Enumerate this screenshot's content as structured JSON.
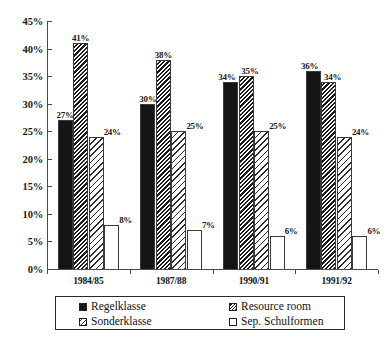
{
  "chart_data": {
    "type": "bar",
    "title": "",
    "subtitle": "",
    "xlabel": "",
    "ylabel": "",
    "ylim": [
      0,
      45
    ],
    "ytick_labels": [
      "0%",
      "5%",
      "10%",
      "15%",
      "20%",
      "25%",
      "30%",
      "35%",
      "40%",
      "45%"
    ],
    "ytick_values": [
      0,
      5,
      10,
      15,
      20,
      25,
      30,
      35,
      40,
      45
    ],
    "grid": false,
    "legend_position": "bottom",
    "value_suffix": "%",
    "categories": [
      "1984/85",
      "1987/88",
      "1990/91",
      "1991/92"
    ],
    "series": [
      {
        "name": "Regelklasse",
        "pattern": "solid",
        "values": [
          27,
          30,
          34,
          36
        ],
        "labels": [
          "27%",
          "30%",
          "34%",
          "36%"
        ]
      },
      {
        "name": "Resource room",
        "pattern": "dense-hatch",
        "values": [
          41,
          38,
          35,
          34
        ],
        "labels": [
          "41%",
          "38%",
          "35%",
          "34%"
        ]
      },
      {
        "name": "Sonderklasse",
        "pattern": "light-hatch",
        "values": [
          24,
          25,
          25,
          24
        ],
        "labels": [
          "24%",
          "25%",
          "25%",
          "24%"
        ]
      },
      {
        "name": "Sep. Schulformen",
        "pattern": "empty",
        "values": [
          8,
          7,
          6,
          6
        ],
        "labels": [
          "8%",
          "7%",
          "6%",
          "6%"
        ]
      }
    ]
  },
  "legend": {
    "items": [
      {
        "label": "Regelklasse",
        "swatch": "solid"
      },
      {
        "label": "Resource room",
        "swatch": "dense-hatch"
      },
      {
        "label": "Sonderklasse",
        "swatch": "light-hatch"
      },
      {
        "label": "Sep. Schulformen",
        "swatch": "empty"
      }
    ]
  }
}
